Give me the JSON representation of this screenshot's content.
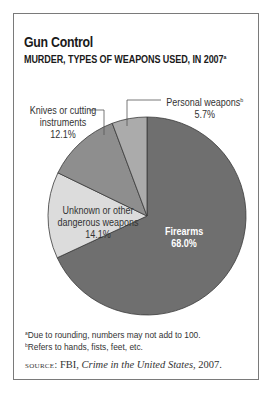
{
  "title": "Gun Control",
  "subtitle": "MURDER, TYPES OF WEAPONS USED, IN 2007",
  "subtitle_note": "a",
  "labels": {
    "personal": {
      "name": "Personal weapons",
      "note": "b",
      "value": "5.7%"
    },
    "knives": {
      "line1": "Knives or cutting",
      "line2": "instruments",
      "value": "12.1%"
    },
    "unknown": {
      "line1": "Unknown or other",
      "line2": "dangerous weapons",
      "value": "14.1%"
    },
    "firearms": {
      "name": "Firearms",
      "value": "68.0%"
    }
  },
  "footnotes": [
    {
      "mark": "a",
      "text": "Due to rounding, numbers may not add to 100."
    },
    {
      "mark": "b",
      "text": "Refers to hands, fists, feet, etc."
    }
  ],
  "source": {
    "label": "source:",
    "org": "FBI,",
    "work": "Crime in the United States",
    "year": ", 2007."
  },
  "chart_data": {
    "type": "pie",
    "title": "Gun Control",
    "subtitle": "Murder, types of weapons used, in 2007",
    "categories": [
      "Firearms",
      "Unknown or other dangerous weapons",
      "Knives or cutting instruments",
      "Personal weapons"
    ],
    "values": [
      68.0,
      14.1,
      12.1,
      5.7
    ],
    "unit": "%",
    "colors": [
      "#6f6f6f",
      "#dcdcdc",
      "#8e8e8e",
      "#ababab"
    ],
    "start_angle": "12 o'clock, clockwise",
    "annotations": [
      "a: Due to rounding, numbers may not add to 100.",
      "b: Refers to hands, fists, feet, etc."
    ],
    "source": "FBI, Crime in the United States, 2007."
  }
}
